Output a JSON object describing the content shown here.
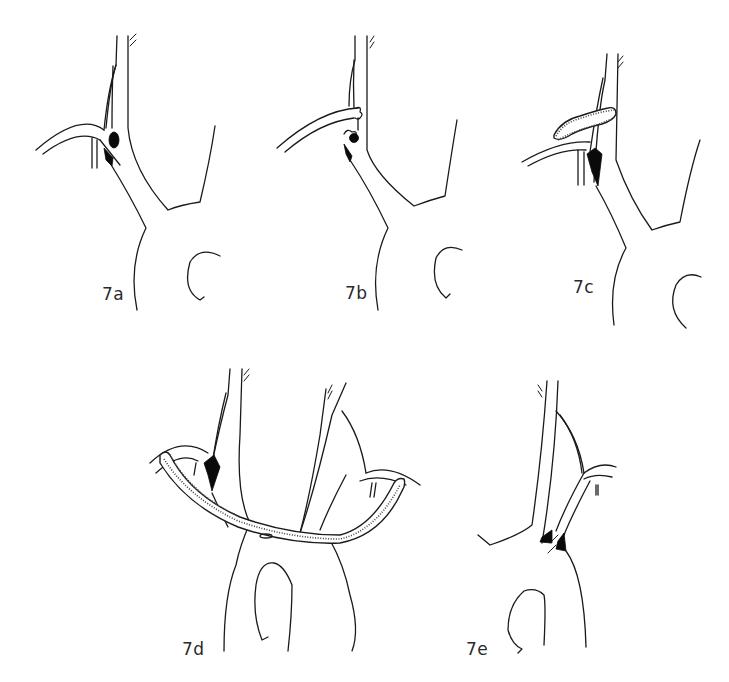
{
  "figure": {
    "colors": {
      "line": "#1a1a1a",
      "fill_occlusion": "#0a0a0a",
      "background": "#ffffff"
    },
    "panels": [
      {
        "id": "7a",
        "label": "7a",
        "features": [
          "arch",
          "branch vessels",
          "occlusion at vessel origin"
        ]
      },
      {
        "id": "7b",
        "label": "7b",
        "features": [
          "arch",
          "divided vessel ends",
          "occlusion"
        ]
      },
      {
        "id": "7c",
        "label": "7c",
        "features": [
          "arch",
          "short graft",
          "occlusion"
        ]
      },
      {
        "id": "7d",
        "label": "7d",
        "features": [
          "arch",
          "long crossover graft",
          "occlusion"
        ]
      },
      {
        "id": "7e",
        "label": "7e",
        "features": [
          "arch",
          "vessel ends with occlusion"
        ]
      }
    ]
  }
}
